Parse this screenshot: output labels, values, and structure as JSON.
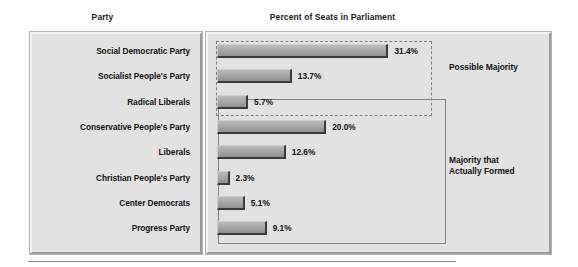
{
  "headers": {
    "party": "Party",
    "percent": "Percent of Seats in Parliament"
  },
  "groups": {
    "possible_majority": "Possible Majority",
    "actually_formed_line1": "Majority that",
    "actually_formed_line2": "Actually Formed"
  },
  "colors": {
    "panel_background": "#e2e2e2",
    "bar_fill": "#a9a9a9",
    "bar_shadow": "#3a3a3a",
    "box_outline": "#7d7d7d",
    "text": "#111111"
  },
  "chart_data": {
    "type": "bar",
    "title": "Percent of Seats in Parliament",
    "xlabel": "Percent of Seats in Parliament",
    "ylabel": "Party",
    "orientation": "horizontal",
    "grid": false,
    "legend_position": "right",
    "xlim": [
      0,
      35
    ],
    "categories": [
      "Social Democratic Party",
      "Socialist People's Party",
      "Radical Liberals",
      "Conservative People's Party",
      "Liberals",
      "Christian People's Party",
      "Center Democrats",
      "Progress Party"
    ],
    "values": [
      31.4,
      13.7,
      5.7,
      20.0,
      12.6,
      2.3,
      5.1,
      9.1
    ],
    "value_labels": [
      "31.4%",
      "13.7%",
      "5.7%",
      "20.0%",
      "12.6%",
      "2.3%",
      "5.1%",
      "9.1%"
    ],
    "annotations": [
      {
        "label": "Possible Majority",
        "style": "dashed-box",
        "members": [
          "Social Democratic Party",
          "Socialist People's Party",
          "Radical Liberals"
        ],
        "total": 50.8
      },
      {
        "label": "Majority that Actually Formed",
        "style": "solid-box",
        "members": [
          "Radical Liberals",
          "Conservative People's Party",
          "Liberals",
          "Christian People's Party",
          "Center Democrats",
          "Progress Party"
        ],
        "total": 54.8
      }
    ]
  }
}
